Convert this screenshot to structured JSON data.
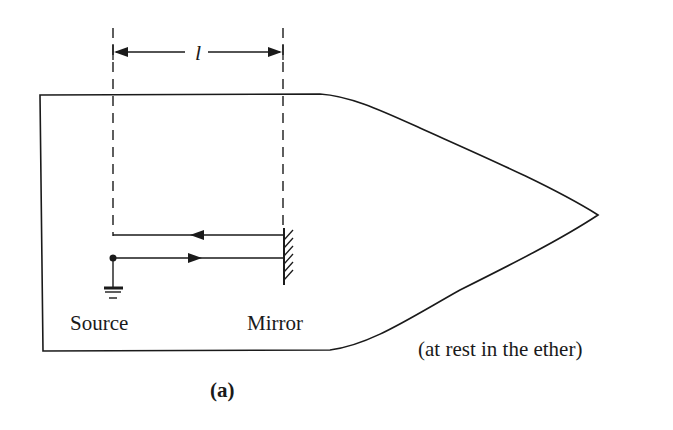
{
  "figure": {
    "label": "(a)",
    "length_symbol": "l",
    "labels": {
      "source": "Source",
      "mirror": "Mirror",
      "frame_note": "(at rest in the ether)"
    },
    "colors": {
      "ink": "#1a1a1a",
      "background": "#ffffff"
    },
    "beams": [
      {
        "name": "return-beam",
        "direction": "left"
      },
      {
        "name": "outgoing-beam",
        "direction": "right"
      }
    ]
  }
}
